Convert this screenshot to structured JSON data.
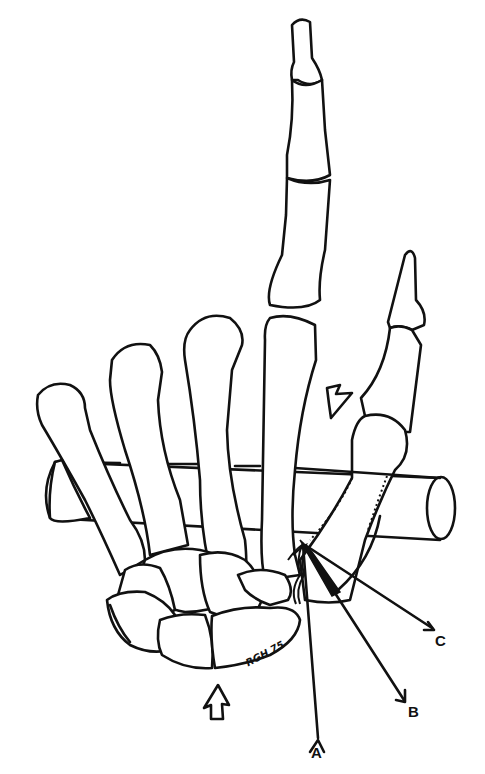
{
  "figure": {
    "labels": {
      "A": "A",
      "B": "B",
      "C": "C"
    },
    "signature": "RGH 75",
    "arrows": [
      {
        "name": "top-arrow",
        "direction": "down-left"
      },
      {
        "name": "bottom-arrow",
        "direction": "up"
      }
    ],
    "colors": {
      "ink": "#111111",
      "background": "#ffffff"
    }
  }
}
